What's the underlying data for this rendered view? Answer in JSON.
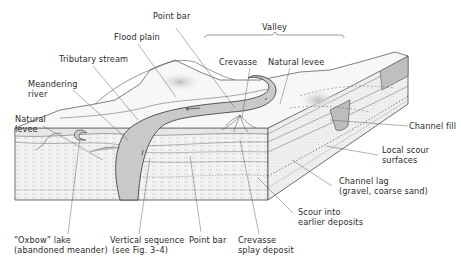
{
  "figure": {
    "type": "block-diagram",
    "colors": {
      "channel": "#c8c8c8",
      "channel_outline": "#4a4a4a",
      "land": "#f4f4f4",
      "sediment": "#e9e9e9",
      "ink": "#3a3a3a",
      "background": "#ffffff"
    }
  },
  "labels": {
    "point_bar_top": "Point bar",
    "valley": "Valley",
    "flood_plain": "Flood plain",
    "crevasse": "Crevasse",
    "natural_levee_top": "Natural levee",
    "tributary_stream": "Tributary stream",
    "meandering_river_line1": "Meandering",
    "meandering_river_line2": "river",
    "natural_levee_left_line1": "Natural",
    "natural_levee_left_line2": "levee",
    "channel_fill": "Channel fill",
    "local_scour_line1": "Local scour",
    "local_scour_line2": "surfaces",
    "channel_lag_line1": "Channel lag",
    "channel_lag_line2": "(gravel, coarse sand)",
    "scour_into_line1": "Scour into",
    "scour_into_line2": "earlier deposits",
    "oxbow_line1": "“Oxbow” lake",
    "oxbow_line2": "(abandoned meander)",
    "vertical_seq_line1": "Vertical sequence",
    "vertical_seq_line2": "(see Fig. 3–4)",
    "point_bar_bottom": "Point bar",
    "crevasse_splay_line1": "Crevasse",
    "crevasse_splay_line2": "splay deposit"
  }
}
